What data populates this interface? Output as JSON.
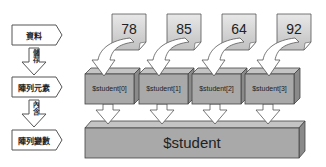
{
  "legend": {
    "steps": [
      {
        "label": "資料"
      },
      {
        "label": "陣列元素"
      },
      {
        "label": "陣列變數"
      }
    ],
    "arrows": [
      {
        "label": "儲存"
      },
      {
        "label": "內含"
      }
    ]
  },
  "data_values": [
    {
      "value": "78"
    },
    {
      "value": "85"
    },
    {
      "value": "64"
    },
    {
      "value": "92"
    }
  ],
  "array_elements": [
    {
      "label": "$student[0]"
    },
    {
      "label": "$student[1]"
    },
    {
      "label": "$student[2]"
    },
    {
      "label": "$student[3]"
    }
  ],
  "array_variable": {
    "label": "$student"
  },
  "colors": {
    "box_front": "#a9a9a9",
    "box_top": "#c4c4c4",
    "box_side": "#8a8a8a",
    "note_fill": "#d6d6d6",
    "outline": "#444444"
  }
}
